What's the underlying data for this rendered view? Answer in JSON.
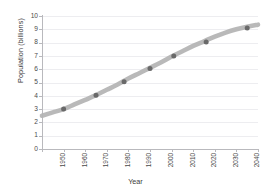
{
  "chart_data": {
    "type": "line",
    "title": "",
    "xlabel": "Year",
    "ylabel": "Population (billions)",
    "xlim": [
      1950,
      2050
    ],
    "ylim": [
      0,
      10
    ],
    "xticks": [
      1950,
      1960,
      1970,
      1980,
      1990,
      2000,
      2010,
      2020,
      2030,
      2040,
      2050
    ],
    "yticks": [
      0,
      1,
      2,
      3,
      4,
      5,
      6,
      7,
      8,
      9,
      10
    ],
    "grid": "horizontal",
    "legend": "none",
    "series": [
      {
        "name": "World population",
        "style": "thick-gray-band-with-markers",
        "line_color": "#b3b3b3",
        "marker_color": "#696969",
        "x": [
          1950,
          1955,
          1960,
          1965,
          1970,
          1975,
          1980,
          1985,
          1990,
          1995,
          2000,
          2005,
          2010,
          2015,
          2020,
          2025,
          2030,
          2035,
          2040,
          2045,
          2050
        ],
        "values": [
          2.5,
          2.75,
          3.0,
          3.35,
          3.7,
          4.05,
          4.45,
          4.85,
          5.3,
          5.7,
          6.1,
          6.5,
          6.95,
          7.35,
          7.75,
          8.1,
          8.45,
          8.75,
          9.0,
          9.2,
          9.35
        ]
      }
    ],
    "markers": [
      {
        "x": 1960,
        "y": 3.0
      },
      {
        "x": 1975,
        "y": 4.05
      },
      {
        "x": 1988,
        "y": 5.05
      },
      {
        "x": 2000,
        "y": 6.05
      },
      {
        "x": 2011,
        "y": 7.0
      },
      {
        "x": 2026,
        "y": 8.05
      },
      {
        "x": 2045,
        "y": 9.1
      }
    ]
  },
  "axis": {
    "y_title": "Population (billions)",
    "x_title": "Year",
    "y_tick_labels": [
      "0",
      "1",
      "2",
      "3",
      "4",
      "5",
      "6",
      "7",
      "8",
      "9",
      "10"
    ],
    "x_tick_labels": [
      "1950",
      "1960",
      "1970",
      "1980",
      "1990",
      "2000",
      "2010",
      "2020",
      "2030",
      "2040",
      "2050"
    ]
  },
  "colors": {
    "band": "#b7b7b7",
    "marker": "#6b6b6b",
    "grid": "#ededf0",
    "spine": "#b9b9bd",
    "text": "#3f3f3f",
    "background": "#ffffff"
  }
}
